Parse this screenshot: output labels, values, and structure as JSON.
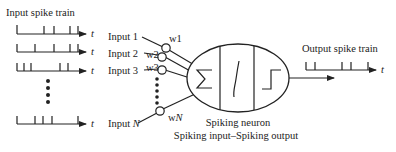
{
  "diagram": {
    "title_left": "Input spike train",
    "title_right": "Output spike train",
    "time_symbol": "t",
    "neuron_label": "Spiking neuron",
    "neuron_sublabel": "Spiking input–Spiking output",
    "neuron_blocks": [
      "summation-sigma",
      "sigmoid-curve",
      "step-threshold"
    ],
    "colors": {
      "stroke": "#222222",
      "background": "#ffffff"
    },
    "inputs": [
      {
        "label": "Input 1",
        "weight": "w1",
        "spikes_x": [
          17,
          44,
          54,
          70,
          78
        ],
        "y": 34
      },
      {
        "label": "Input 2",
        "weight": "w2",
        "spikes_x": [
          17,
          35,
          54,
          70,
          78
        ],
        "y": 52
      },
      {
        "label": "Input 3",
        "weight": "w3",
        "spikes_x": [
          17,
          24,
          31,
          60,
          68
        ],
        "y": 71
      },
      {
        "label": "Input N",
        "weight": "wN",
        "spikes_x": [
          17,
          35,
          43,
          52,
          78
        ],
        "y": 124
      }
    ],
    "output": {
      "spikes_x": [
        306,
        315,
        342,
        351,
        368
      ],
      "y": 70
    }
  }
}
